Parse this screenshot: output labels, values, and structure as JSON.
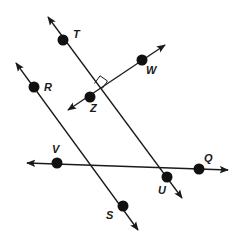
{
  "diagram": {
    "colors": {
      "line": "#1a1a1a",
      "point": "#111111",
      "background": "#ffffff"
    },
    "points": [
      {
        "id": "T",
        "label": "T",
        "x": 63,
        "y": 40,
        "lx": 73,
        "ly": 38
      },
      {
        "id": "W",
        "label": "W",
        "x": 142,
        "y": 60,
        "lx": 146,
        "ly": 74
      },
      {
        "id": "Z",
        "label": "Z",
        "x": 90,
        "y": 97,
        "lx": 90,
        "ly": 112
      },
      {
        "id": "R",
        "label": "R",
        "x": 34,
        "y": 87,
        "lx": 44,
        "ly": 91
      },
      {
        "id": "V",
        "label": "V",
        "x": 57,
        "y": 163,
        "lx": 52,
        "ly": 153
      },
      {
        "id": "Q",
        "label": "Q",
        "x": 199,
        "y": 169,
        "lx": 204,
        "ly": 162
      },
      {
        "id": "U",
        "label": "U",
        "x": 167,
        "y": 177,
        "lx": 158,
        "ly": 194
      },
      {
        "id": "S",
        "label": "S",
        "x": 123,
        "y": 206,
        "lx": 106,
        "ly": 219
      }
    ],
    "lines": [
      {
        "id": "line-TU",
        "name": "line TU",
        "x1": 48,
        "y1": 17,
        "x2": 182,
        "y2": 198
      },
      {
        "id": "line-ZW",
        "name": "line ZW",
        "x1": 68,
        "y1": 110,
        "x2": 165,
        "y2": 45
      },
      {
        "id": "line-RS",
        "name": "line RS",
        "x1": 16,
        "y1": 63,
        "x2": 138,
        "y2": 230
      },
      {
        "id": "line-VQ",
        "name": "line VQ",
        "x1": 27,
        "y1": 163,
        "x2": 228,
        "y2": 170
      }
    ],
    "annotations": [
      {
        "type": "right-angle",
        "at": "intersection of TU and ZW"
      }
    ]
  }
}
